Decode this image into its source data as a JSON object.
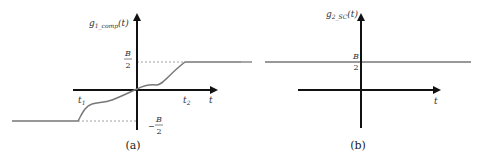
{
  "panel_a": {
    "y_label": "g",
    "y_label_sub": "1_comp",
    "y_label_arg": "(t)",
    "x_label": "t",
    "upper_level_num": "B",
    "upper_level_den": "2",
    "lower_level_sign": "−",
    "lower_level_num": "B",
    "lower_level_den": "2",
    "t1_label": "t",
    "t1_sub": "1",
    "t2_label": "t",
    "t2_sub": "2",
    "caption": "(a)"
  },
  "panel_b": {
    "y_label": "g",
    "y_label_sub": "2_SC",
    "y_label_arg": "(t)",
    "x_label": "t",
    "level_num": "B",
    "level_den": "2",
    "caption": "(b)"
  },
  "colors": {
    "axis": "#111111",
    "curve": "#777777",
    "dashed": "#888888"
  }
}
